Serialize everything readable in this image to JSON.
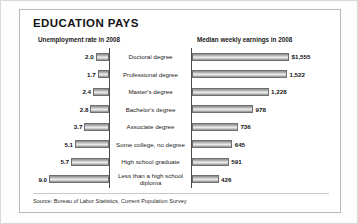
{
  "panel": {
    "title": "EDUCATION PAYS",
    "left_header": "Unemployment rate in 2008",
    "right_header": "Median weekly earnings in 2008",
    "source": "Source: Bureau of Labor Statistics, Current Population Survey"
  },
  "chart_data": {
    "type": "bar",
    "title": "EDUCATION PAYS",
    "orientation": "horizontal",
    "layout": "back-to-back paired bars about a central category column",
    "grid": false,
    "legend": null,
    "categories": [
      "Doctoral degree",
      "Professional degree",
      "Master's degree",
      "Bachelor's degree",
      "Associate degree",
      "Some college, no degree",
      "High school graduate",
      "Less than a high school diploma"
    ],
    "series": [
      {
        "name": "Unemployment rate in 2008",
        "side": "left",
        "unit": "percent",
        "axis_direction": "right-to-left",
        "xlim": [
          0,
          9.0
        ],
        "values": [
          2.0,
          1.7,
          2.4,
          2.8,
          3.7,
          5.1,
          5.7,
          9.0
        ],
        "labels": [
          "2.0",
          "1.7",
          "2.4",
          "2.8",
          "3.7",
          "5.1",
          "5.7",
          "9.0"
        ]
      },
      {
        "name": "Median weekly earnings in 2008",
        "side": "right",
        "unit": "US dollars per week",
        "axis_direction": "left-to-right",
        "xlim": [
          0,
          1555
        ],
        "values": [
          1555,
          1522,
          1228,
          978,
          736,
          645,
          591,
          426
        ],
        "labels": [
          "$1,555",
          "1,522",
          "1,228",
          "978",
          "736",
          "645",
          "591",
          "426"
        ]
      }
    ],
    "xlabel": "",
    "ylabel": ""
  },
  "rows": [
    {
      "category": "Doctoral degree",
      "unemployment_label": "2.0",
      "unemployment_value": 2.0,
      "earnings_label": "$1,555",
      "earnings_value": 1555
    },
    {
      "category": "Professional degree",
      "unemployment_label": "1.7",
      "unemployment_value": 1.7,
      "earnings_label": "1,522",
      "earnings_value": 1522
    },
    {
      "category": "Master's degree",
      "unemployment_label": "2.4",
      "unemployment_value": 2.4,
      "earnings_label": "1,228",
      "earnings_value": 1228
    },
    {
      "category": "Bachelor's degree",
      "unemployment_label": "2.8",
      "unemployment_value": 2.8,
      "earnings_label": "978",
      "earnings_value": 978
    },
    {
      "category": "Associate degree",
      "unemployment_label": "3.7",
      "unemployment_value": 3.7,
      "earnings_label": "736",
      "earnings_value": 736
    },
    {
      "category": "Some college, no degree",
      "unemployment_label": "5.1",
      "unemployment_value": 5.1,
      "earnings_label": "645",
      "earnings_value": 645
    },
    {
      "category": "High school graduate",
      "unemployment_label": "5.7",
      "unemployment_value": 5.7,
      "earnings_label": "591",
      "earnings_value": 591
    },
    {
      "category": "Less than a high school diploma",
      "unemployment_label": "9.0",
      "unemployment_value": 9.0,
      "earnings_label": "426",
      "earnings_value": 426
    }
  ],
  "scale": {
    "left_max_value": 9.0,
    "left_max_px": 60,
    "right_max_value": 1555,
    "right_max_px": 97
  }
}
